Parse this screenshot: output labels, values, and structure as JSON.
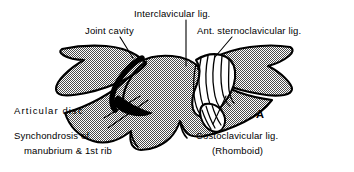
{
  "figure": {
    "panel_letter": "A",
    "background_color": "#ffffff",
    "ink_color": "#000000",
    "stipple_color": "#9a9a9a",
    "labels": [
      {
        "id": "interclavicular",
        "text": "Interclavicular lig.",
        "x": 134,
        "y": 8
      },
      {
        "id": "joint-cavity",
        "text": "Joint cavity",
        "x": 85,
        "y": 25
      },
      {
        "id": "ant-sternoclavicular",
        "text": "Ant. sternoclavicular lig.",
        "x": 197,
        "y": 25
      },
      {
        "id": "articular-disc",
        "text": "Articular  disc",
        "x": 14,
        "y": 105
      },
      {
        "id": "synchondrosis-line1",
        "text": "Synchondrosis  of",
        "x": 14,
        "y": 130
      },
      {
        "id": "synchondrosis-line2",
        "text": "manubrium  &  1st  rib",
        "x": 24,
        "y": 145
      },
      {
        "id": "costoclavicular-line1",
        "text": "Costoclavicular  lig.",
        "x": 196,
        "y": 130
      },
      {
        "id": "costoclavicular-line2",
        "text": "(Rhomboid)",
        "x": 212,
        "y": 145
      }
    ]
  }
}
